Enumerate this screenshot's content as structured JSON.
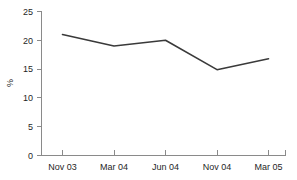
{
  "chart_data": {
    "type": "line",
    "title": "",
    "subtitle": "",
    "xlabel": "",
    "ylabel": "%",
    "categories": [
      "Nov 03",
      "Mar 04",
      "Jun 04",
      "Nov 04",
      "Mar 05"
    ],
    "values": [
      21.0,
      19.0,
      20.0,
      14.9,
      16.8
    ],
    "series": [
      {
        "name": "",
        "values": [
          21.0,
          19.0,
          20.0,
          14.9,
          16.8
        ]
      }
    ],
    "ylim": [
      0,
      25
    ],
    "ytick_labels": [
      "0",
      "5",
      "10",
      "15",
      "20",
      "25"
    ],
    "ytick_values": [
      0,
      5,
      10,
      15,
      20,
      25
    ],
    "xtick_labels": [
      "Nov 03",
      "Mar 04",
      "Jun 04",
      "Nov 04",
      "Mar 05"
    ],
    "grid": false,
    "legend": false,
    "legend_position": "none",
    "markers": false,
    "colors": {
      "line": "#3a3a3a",
      "axis": "#8a8a8a",
      "text": "#1f1f1f",
      "background": "#ffffff"
    }
  },
  "axes": {
    "y_label": "%",
    "y_ticks": [
      {
        "label": "25",
        "value": 25
      },
      {
        "label": "20",
        "value": 20
      },
      {
        "label": "15",
        "value": 15
      },
      {
        "label": "10",
        "value": 10
      },
      {
        "label": "5",
        "value": 5
      },
      {
        "label": "0",
        "value": 0
      }
    ],
    "x_ticks": [
      {
        "label": "Nov 03",
        "value": 21.0
      },
      {
        "label": "Mar 04",
        "value": 19.0
      },
      {
        "label": "Jun 04",
        "value": 20.0
      },
      {
        "label": "Nov 04",
        "value": 14.9
      },
      {
        "label": "Mar 05",
        "value": 16.8
      }
    ]
  }
}
